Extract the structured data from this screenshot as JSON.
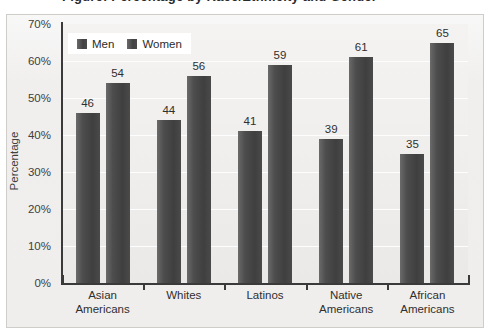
{
  "title_sliver": "Figure: Percentage by Race/Ethnicity and Gender",
  "chart_data": {
    "type": "bar",
    "title": "",
    "xlabel": "",
    "ylabel": "Percentage",
    "ylim": [
      0,
      70
    ],
    "ytick_step": 10,
    "grid": true,
    "legend_position": "top-left",
    "categories": [
      "Asian Americans",
      "Whites",
      "Latinos",
      "Native Americans",
      "African Americans"
    ],
    "category_lines": [
      [
        "Asian",
        "Americans"
      ],
      [
        "Whites",
        ""
      ],
      [
        "Latinos",
        ""
      ],
      [
        "Native",
        "Americans"
      ],
      [
        "African",
        "Americans"
      ]
    ],
    "series": [
      {
        "name": "Men",
        "values": [
          46,
          44,
          41,
          39,
          35
        ]
      },
      {
        "name": "Women",
        "values": [
          54,
          56,
          59,
          61,
          65
        ]
      }
    ],
    "ytick_labels": [
      "0%",
      "10%",
      "20%",
      "30%",
      "40%",
      "50%",
      "60%",
      "70%"
    ],
    "ytick_values": [
      0,
      10,
      20,
      30,
      40,
      50,
      60,
      70
    ],
    "bar_color": "#4a4a4a",
    "plot_background": "#efeeec",
    "page_background": "#f0efee"
  },
  "legend": {
    "items": [
      {
        "label": "Men"
      },
      {
        "label": "Women"
      }
    ]
  }
}
